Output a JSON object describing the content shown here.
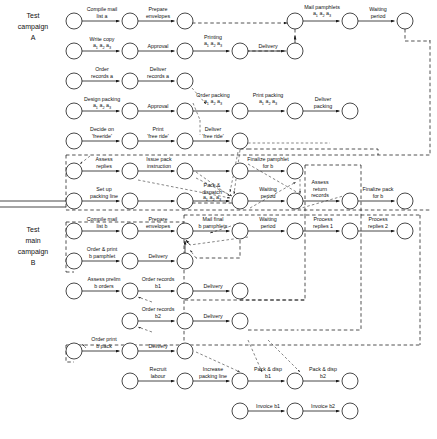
{
  "figure": {
    "caption": "",
    "side_labels": [
      {
        "id": "camp-a",
        "lines": [
          "Test",
          "campaign",
          "A"
        ]
      },
      {
        "id": "camp-b",
        "lines": [
          "Test",
          "main",
          "campaign",
          "B"
        ]
      }
    ],
    "node_radius": 8,
    "rows": [
      {
        "id": "row-1",
        "y": 21,
        "nodes": [
          74,
          130,
          185,
          295,
          350,
          405
        ],
        "labels": [
          {
            "x": 102,
            "y": 10,
            "lines": [
              "Compile mail",
              "list a"
            ]
          },
          {
            "x": 158,
            "y": 10,
            "lines": [
              "Prepare",
              "envelopes"
            ]
          },
          {
            "x": 322,
            "y": 8,
            "lines": [
              "Mail pamphlets"
            ],
            "sub": "a1 a2 a3"
          },
          {
            "x": 378,
            "y": 10,
            "lines": [
              "Waiting",
              "period"
            ]
          }
        ]
      },
      {
        "id": "row-2",
        "y": 51,
        "nodes": [
          74,
          130,
          185,
          240,
          295
        ],
        "labels": [
          {
            "x": 102,
            "y": 40,
            "lines": [
              "Write copy"
            ],
            "sub": "a1 a2 a3"
          },
          {
            "x": 158,
            "y": 47,
            "lines": [
              "Approval"
            ]
          },
          {
            "x": 213,
            "y": 38,
            "lines": [
              "Printing"
            ],
            "sub": "a1 a2 a3"
          },
          {
            "x": 268,
            "y": 47,
            "lines": [
              "Delivery"
            ]
          }
        ]
      },
      {
        "id": "row-3",
        "y": 81,
        "nodes": [
          74,
          130,
          185
        ],
        "labels": [
          {
            "x": 102,
            "y": 70,
            "lines": [
              "Order",
              "records a"
            ]
          },
          {
            "x": 158,
            "y": 70,
            "lines": [
              "Deliver",
              "records a"
            ]
          }
        ]
      },
      {
        "id": "row-4",
        "y": 111,
        "nodes": [
          74,
          130,
          185,
          240,
          295,
          350
        ],
        "labels": [
          {
            "x": 102,
            "y": 100,
            "lines": [
              "Design packing"
            ],
            "sub": "a1 a2 a3"
          },
          {
            "x": 158,
            "y": 107,
            "lines": [
              "Approval"
            ]
          },
          {
            "x": 213,
            "y": 96,
            "lines": [
              "Order packing"
            ],
            "sub": "a1 a2 a3"
          },
          {
            "x": 268,
            "y": 96,
            "lines": [
              "Print packing"
            ],
            "sub": "a1 a2 a3"
          },
          {
            "x": 323,
            "y": 100,
            "lines": [
              "Deliver",
              "packing"
            ]
          }
        ]
      },
      {
        "id": "row-5",
        "y": 141,
        "nodes": [
          74,
          130,
          185,
          240
        ],
        "labels": [
          {
            "x": 102,
            "y": 130,
            "lines": [
              "Decide on",
              "'freeride'"
            ]
          },
          {
            "x": 158,
            "y": 130,
            "lines": [
              "Print",
              "'free ride'"
            ]
          },
          {
            "x": 213,
            "y": 130,
            "lines": [
              "Deliver",
              "'free ride'"
            ]
          }
        ]
      },
      {
        "id": "row-6",
        "y": 171,
        "nodes": [
          74,
          130,
          185,
          240,
          295
        ],
        "labels": [
          {
            "x": 104,
            "y": 160,
            "lines": [
              "Assess",
              "replies"
            ]
          },
          {
            "x": 159,
            "y": 160,
            "lines": [
              "Issue pack",
              "instruction"
            ]
          },
          {
            "x": 268,
            "y": 160,
            "lines": [
              "Finalize pamphlet",
              "for b"
            ]
          }
        ]
      },
      {
        "id": "row-7",
        "y": 201,
        "nodes": [
          74,
          130,
          185,
          240,
          295,
          350,
          405
        ],
        "labels": [
          {
            "x": 104,
            "y": 190,
            "lines": [
              "Set up",
              "packing line"
            ]
          },
          {
            "x": 212,
            "y": 186,
            "lines": [
              "Pack &",
              "dispatch"
            ],
            "sub": "a1 a2 a3"
          },
          {
            "x": 268,
            "y": 190,
            "lines": [
              "Waiting",
              "period"
            ]
          },
          {
            "x": 320,
            "y": 183,
            "lines": [
              "Assess",
              "return",
              "records"
            ]
          },
          {
            "x": 378,
            "y": 190,
            "lines": [
              "Finalize pack",
              "for b"
            ]
          }
        ]
      },
      {
        "id": "row-8",
        "y": 231,
        "nodes": [
          74,
          130,
          185,
          240,
          295,
          350,
          405
        ],
        "labels": [
          {
            "x": 102,
            "y": 220,
            "lines": [
              "Compile mail",
              "list b"
            ]
          },
          {
            "x": 158,
            "y": 220,
            "lines": [
              "Prepare",
              "envelopes"
            ]
          },
          {
            "x": 213,
            "y": 220,
            "lines": [
              "Mail final",
              "b pamphlets"
            ]
          },
          {
            "x": 268,
            "y": 220,
            "lines": [
              "Waiting",
              "period"
            ]
          },
          {
            "x": 323,
            "y": 220,
            "lines": [
              "Process",
              "replies 1"
            ]
          },
          {
            "x": 378,
            "y": 220,
            "lines": [
              "Process",
              "replies 2"
            ]
          }
        ]
      },
      {
        "id": "row-9",
        "y": 261,
        "nodes": [
          74,
          130,
          185
        ],
        "labels": [
          {
            "x": 102,
            "y": 250,
            "lines": [
              "Order & print",
              "b pamphlet"
            ]
          },
          {
            "x": 158,
            "y": 257,
            "lines": [
              "Delivery"
            ]
          }
        ]
      },
      {
        "id": "row-10",
        "y": 291,
        "nodes": [
          74,
          130,
          185,
          240
        ],
        "labels": [
          {
            "x": 104,
            "y": 280,
            "lines": [
              "Assess prelim",
              "b orders"
            ]
          },
          {
            "x": 158,
            "y": 280,
            "lines": [
              "Order records",
              "b1"
            ]
          },
          {
            "x": 213,
            "y": 287,
            "lines": [
              "Delivery"
            ]
          }
        ]
      },
      {
        "id": "row-11",
        "y": 321,
        "nodes": [
          130,
          185,
          240
        ],
        "labels": [
          {
            "x": 158,
            "y": 310,
            "lines": [
              "Order records",
              "b2"
            ]
          },
          {
            "x": 213,
            "y": 317,
            "lines": [
              "Delivery"
            ]
          }
        ]
      },
      {
        "id": "row-12",
        "y": 351,
        "nodes": [
          74,
          130,
          185
        ],
        "labels": [
          {
            "x": 104,
            "y": 340,
            "lines": [
              "Order print",
              "b pack"
            ]
          },
          {
            "x": 158,
            "y": 347,
            "lines": [
              "Delivery"
            ]
          }
        ]
      },
      {
        "id": "row-13",
        "y": 381,
        "nodes": [
          130,
          185,
          240,
          295,
          350
        ],
        "labels": [
          {
            "x": 158,
            "y": 370,
            "lines": [
              "Recruit",
              "labour"
            ]
          },
          {
            "x": 213,
            "y": 370,
            "lines": [
              "Increase",
              "packing line"
            ]
          },
          {
            "x": 268,
            "y": 370,
            "lines": [
              "Pack & disp",
              "b1"
            ]
          },
          {
            "x": 323,
            "y": 370,
            "lines": [
              "Pack & disp",
              "b2"
            ]
          }
        ]
      },
      {
        "id": "row-14",
        "y": 411,
        "nodes": [
          240,
          295,
          350
        ],
        "labels": [
          {
            "x": 268,
            "y": 407,
            "lines": [
              "Invoice b1"
            ]
          },
          {
            "x": 323,
            "y": 407,
            "lines": [
              "Invoice b2"
            ]
          }
        ]
      }
    ]
  }
}
